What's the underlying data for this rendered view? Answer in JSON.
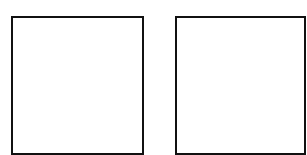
{
  "diagram": {
    "shapes": [
      {
        "type": "square",
        "label": "",
        "fill": "#ffffff",
        "stroke": "#111111"
      },
      {
        "type": "square",
        "label": "",
        "fill": "#ffffff",
        "stroke": "#111111"
      }
    ]
  }
}
